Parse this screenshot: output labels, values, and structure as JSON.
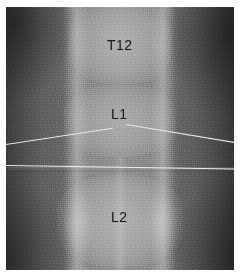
{
  "figure": {
    "kind": "radiograph",
    "modality_label": "x-ray-lumbar-spine-ap",
    "background_color": "#ffffff",
    "plate_color": "#6e6e6e",
    "annotation_color": "#1c1c1c",
    "marker_line_color": "#efefe9"
  },
  "annotations": [
    {
      "id": "t12",
      "text": "T12",
      "x": 101,
      "y": 31
    },
    {
      "id": "l1",
      "text": "L1",
      "x": 105,
      "y": 100
    },
    {
      "id": "l2",
      "text": "L2",
      "x": 105,
      "y": 203
    }
  ],
  "markers": {
    "horizontal_line": "horizontal-reference-line",
    "left_diagonal": "left-diagonal-reference-line",
    "right_diagonal": "right-diagonal-reference-line"
  },
  "anatomy": {
    "vertebra_t12": "T12 vertebral body",
    "vertebra_l1": "L1 vertebral body",
    "vertebra_l2": "L2 vertebral body",
    "pedicle_left": "left paravertebral stripe",
    "pedicle_right": "right paravertebral stripe",
    "spine_column": "central vertebral column"
  }
}
